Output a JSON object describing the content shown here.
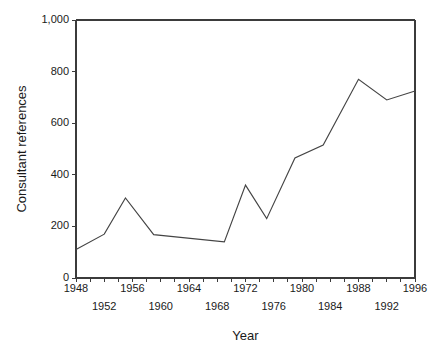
{
  "chart_data": {
    "type": "line",
    "title": "",
    "xlabel": "Year",
    "ylabel": "Consultant references",
    "xlim": [
      1948,
      1996
    ],
    "ylim": [
      0,
      1000
    ],
    "grid": false,
    "legend": null,
    "x_tick_labels": [
      "1948",
      "1952",
      "1956",
      "1960",
      "1964",
      "1968",
      "1972",
      "1976",
      "1980",
      "1984",
      "1988",
      "1992",
      "1996"
    ],
    "x_tick_values": [
      1948,
      1952,
      1956,
      1960,
      1964,
      1968,
      1972,
      1976,
      1980,
      1984,
      1988,
      1992,
      1996
    ],
    "x_minor_tick_values": [
      1948,
      1950,
      1952,
      1954,
      1956,
      1958,
      1960,
      1962,
      1964,
      1966,
      1968,
      1970,
      1972,
      1974,
      1976,
      1978,
      1980,
      1982,
      1984,
      1986,
      1988,
      1990,
      1992,
      1994,
      1996
    ],
    "x_tick_label_rows": [
      0,
      1,
      0,
      1,
      0,
      1,
      0,
      1,
      0,
      1,
      0,
      1,
      0
    ],
    "y_tick_labels": [
      "0",
      "200",
      "400",
      "600",
      "800",
      "1,000"
    ],
    "y_tick_values": [
      0,
      200,
      400,
      600,
      800,
      1000
    ],
    "series": [
      {
        "name": "Consultant references",
        "color": "#444444",
        "x": [
          1948,
          1952,
          1955,
          1959,
          1969,
          1972,
          1975,
          1979,
          1983,
          1988,
          1992,
          1996
        ],
        "values": [
          110,
          170,
          310,
          168,
          140,
          360,
          230,
          465,
          515,
          770,
          690,
          725
        ]
      }
    ]
  },
  "plot_geometry": {
    "left": 76,
    "right": 415,
    "top": 20,
    "bottom": 278,
    "tick_length": 4,
    "xlabel_row0_y": 292,
    "xlabel_row1_y": 310,
    "axis_title_x_y": 340,
    "axis_title_y_x": 26
  },
  "colors": {
    "axis": "#3b3b3b",
    "line": "#444444",
    "text": "#1a1a1a",
    "background": "#ffffff"
  }
}
